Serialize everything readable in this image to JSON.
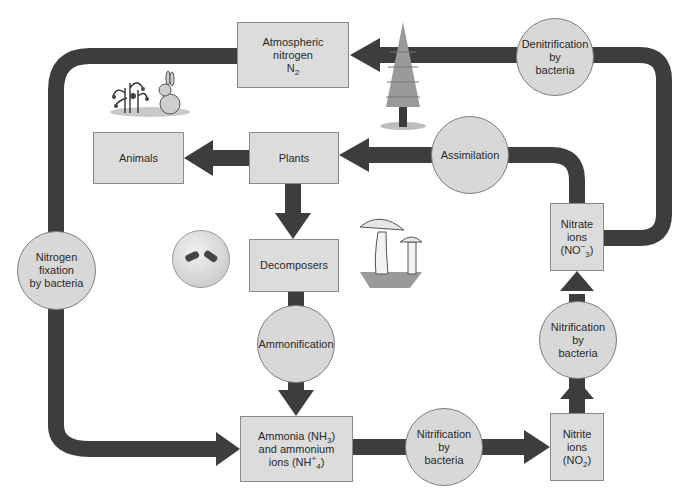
{
  "diagram": {
    "colors": {
      "arrow": "#3d3d3d",
      "box_fill": "#dcdcdc",
      "circle_fill": "#d8d8d8",
      "border": "#808080"
    },
    "boxes": {
      "atmospheric": {
        "line1": "Atmospheric",
        "line2": "nitrogen",
        "line3_main": "N",
        "line3_sub": "2"
      },
      "animals": {
        "label": "Animals"
      },
      "plants": {
        "label": "Plants"
      },
      "decomposers": {
        "label": "Decomposers"
      },
      "ammonia": {
        "line1_main": "Ammonia (NH",
        "line1_sub": "3",
        "line1_end": ")",
        "line2": "and ammonium",
        "line3_main": "ions (NH",
        "line3_sub": "4",
        "line3_sup": "+",
        "line3_end": ")"
      },
      "nitrite": {
        "line1": "Nitrite",
        "line2": "ions",
        "line3_main": "(NO",
        "line3_sub": "2",
        "line3_end": ")"
      },
      "nitrate": {
        "line1": "Nitrate",
        "line2": "ions",
        "line3_main": "(NO",
        "line3_sub": "3",
        "line3_sup": "−",
        "line3_end": ")"
      }
    },
    "processes": {
      "denitrification": {
        "line1": "Denitrification",
        "line2": "by",
        "line3": "bacteria"
      },
      "assimilation": {
        "label": "Assimilation"
      },
      "nitrogen_fixation": {
        "line1": "Nitrogen",
        "line2": "fixation",
        "line3": "by bacteria"
      },
      "ammonification": {
        "label": "Ammonification"
      },
      "nitrification_bottom": {
        "line1": "Nitrification",
        "line2": "by",
        "line3": "bacteria"
      },
      "nitrification_right": {
        "line1": "Nitrification",
        "line2": "by",
        "line3": "bacteria"
      }
    },
    "illustrations": [
      "plant-and-rabbit",
      "pine-tree",
      "bacteria-dish",
      "mushrooms"
    ]
  }
}
